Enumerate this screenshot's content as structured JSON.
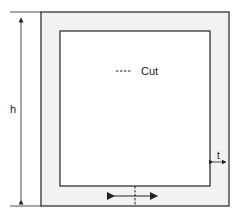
{
  "diagram": {
    "legend": {
      "symbol": "----",
      "label": "Cut"
    },
    "dimensions": {
      "height_label": "h",
      "thickness_label": "t"
    },
    "colors": {
      "wall_fill": "#f2f2f2",
      "stroke": "#222222",
      "interior": "#ffffff"
    }
  }
}
